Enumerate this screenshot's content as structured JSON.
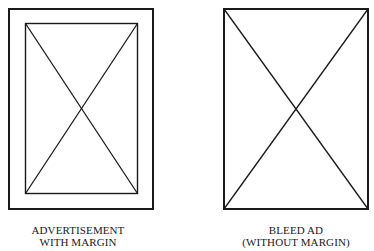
{
  "diagrams": [
    {
      "id": "with-margin",
      "label_line1": "ADVERTISEMENT",
      "label_line2": "WITH MARGIN",
      "outer_box": {
        "x": 8,
        "y": 8,
        "w": 146,
        "h": 202
      },
      "inner_box": {
        "x": 25,
        "y": 23,
        "w": 113,
        "h": 171
      },
      "has_diagonals": true
    },
    {
      "id": "bleed",
      "label_line1": "BLEED AD",
      "label_line2": "(WITHOUT MARGIN)",
      "outer_box": {
        "x": 223,
        "y": 8,
        "w": 146,
        "h": 202
      },
      "has_diagonals": true
    }
  ],
  "colors": {
    "line": "#1a1a1a",
    "background": "#ffffff"
  }
}
